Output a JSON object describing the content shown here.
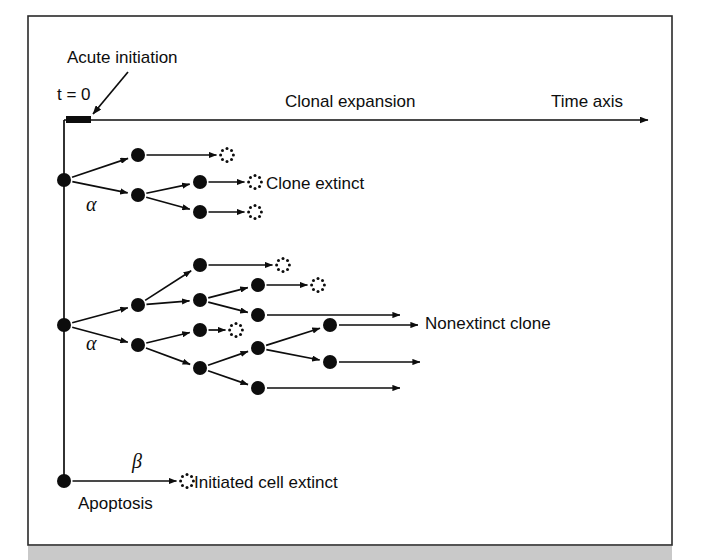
{
  "figure": {
    "kind": "branching-process-diagram",
    "background_color": "#ffffff",
    "ink_color": "#0d0d0d",
    "frame": {
      "x": 28,
      "y": 16,
      "width": 644,
      "height": 529,
      "border_color": "#2a2a2a"
    },
    "scan_bar": {
      "color": "#c9c9c9",
      "x": 28,
      "y": 546,
      "width": 644,
      "height": 14
    }
  },
  "labels": {
    "acute_initiation": "Acute initiation",
    "t_zero": "t = 0",
    "clonal_expansion": "Clonal expansion",
    "time_axis": "Time axis",
    "clone_extinct": "Clone extinct",
    "nonextinct_clone": "Nonextinct clone",
    "initiated_cell_extinct": "Initiated cell extinct",
    "apoptosis": "Apoptosis",
    "alpha_upper": "α",
    "alpha_lower": "α",
    "beta": "β"
  },
  "axes": {
    "vertical": {
      "x": 64,
      "y_top": 120,
      "y_bottom": 481
    },
    "horizontal": {
      "y": 120,
      "x_start": 64,
      "x_end": 648,
      "arrow": "right"
    },
    "origin_tick": {
      "x": 66,
      "y": 116,
      "width": 25,
      "height": 7
    }
  },
  "pointer": {
    "name": "acute-initiation-arrow",
    "x1": 128,
    "y1": 72,
    "x2": 93,
    "y2": 114
  },
  "text_positions": {
    "acute_initiation": {
      "x": 67,
      "y": 63,
      "size": 17
    },
    "t_zero": {
      "x": 57,
      "y": 100,
      "size": 17
    },
    "clonal_expansion": {
      "x": 285,
      "y": 107,
      "size": 17
    },
    "time_axis": {
      "x": 551,
      "y": 107,
      "size": 17
    },
    "clone_extinct": {
      "x": 266,
      "y": 189,
      "size": 17
    },
    "nonextinct_clone": {
      "x": 425,
      "y": 329,
      "size": 17
    },
    "initiated_cell_extinct": {
      "x": 194,
      "y": 488,
      "size": 17
    },
    "apoptosis": {
      "x": 78,
      "y": 509,
      "size": 17
    },
    "alpha_upper": {
      "x": 86,
      "y": 211,
      "size": 20
    },
    "alpha_lower": {
      "x": 86,
      "y": 350,
      "size": 20
    },
    "beta": {
      "x": 132,
      "y": 468,
      "size": 20
    }
  },
  "nodes": [
    {
      "id": "root-upper",
      "type": "cell",
      "x": 64,
      "y": 180,
      "r": 7
    },
    {
      "id": "u-g1-a",
      "type": "cell",
      "x": 138,
      "y": 155,
      "r": 7
    },
    {
      "id": "u-g1-b",
      "type": "cell",
      "x": 138,
      "y": 195,
      "r": 7
    },
    {
      "id": "u-g2-a",
      "type": "cell",
      "x": 200,
      "y": 182,
      "r": 7
    },
    {
      "id": "u-g2-b",
      "type": "cell",
      "x": 200,
      "y": 212,
      "r": 7
    },
    {
      "id": "u-x1",
      "type": "extinct",
      "x": 227,
      "y": 155,
      "r": 7
    },
    {
      "id": "u-x2",
      "type": "extinct",
      "x": 255,
      "y": 182,
      "r": 7
    },
    {
      "id": "u-x3",
      "type": "extinct",
      "x": 255,
      "y": 212,
      "r": 7
    },
    {
      "id": "root-middle",
      "type": "cell",
      "x": 64,
      "y": 325,
      "r": 7
    },
    {
      "id": "m-g1-a",
      "type": "cell",
      "x": 138,
      "y": 305,
      "r": 7
    },
    {
      "id": "m-g1-b",
      "type": "cell",
      "x": 138,
      "y": 345,
      "r": 7
    },
    {
      "id": "m-g2-a",
      "type": "cell",
      "x": 200,
      "y": 265,
      "r": 7
    },
    {
      "id": "m-g2-b",
      "type": "cell",
      "x": 200,
      "y": 300,
      "r": 7
    },
    {
      "id": "m-g2-c",
      "type": "cell",
      "x": 200,
      "y": 330,
      "r": 7
    },
    {
      "id": "m-g2-d",
      "type": "cell",
      "x": 200,
      "y": 368,
      "r": 7
    },
    {
      "id": "m-g3-a",
      "type": "cell",
      "x": 258,
      "y": 285,
      "r": 7
    },
    {
      "id": "m-g3-b",
      "type": "cell",
      "x": 258,
      "y": 315,
      "r": 7
    },
    {
      "id": "m-g3-c",
      "type": "cell",
      "x": 258,
      "y": 348,
      "r": 7
    },
    {
      "id": "m-g3-d",
      "type": "cell",
      "x": 258,
      "y": 388,
      "r": 7
    },
    {
      "id": "m-g4-a",
      "type": "cell",
      "x": 330,
      "y": 325,
      "r": 7
    },
    {
      "id": "m-g4-b",
      "type": "cell",
      "x": 330,
      "y": 362,
      "r": 7
    },
    {
      "id": "m-x1",
      "type": "extinct",
      "x": 283,
      "y": 265,
      "r": 7
    },
    {
      "id": "m-x2",
      "type": "extinct",
      "x": 318,
      "y": 285,
      "r": 7
    },
    {
      "id": "m-x3",
      "type": "extinct",
      "x": 236,
      "y": 330,
      "r": 7
    },
    {
      "id": "root-lower",
      "type": "cell",
      "x": 64,
      "y": 481,
      "r": 7
    },
    {
      "id": "l-x1",
      "type": "extinct",
      "x": 187,
      "y": 481,
      "r": 7
    }
  ],
  "edges": [
    {
      "from": "root-upper",
      "to": "u-g1-a"
    },
    {
      "from": "root-upper",
      "to": "u-g1-b"
    },
    {
      "from": "u-g1-b",
      "to": "u-g2-a"
    },
    {
      "from": "u-g1-b",
      "to": "u-g2-b"
    },
    {
      "from": "u-g1-a",
      "to": "u-x1"
    },
    {
      "from": "u-g2-a",
      "to": "u-x2"
    },
    {
      "from": "u-g2-b",
      "to": "u-x3"
    },
    {
      "from": "root-middle",
      "to": "m-g1-a"
    },
    {
      "from": "root-middle",
      "to": "m-g1-b"
    },
    {
      "from": "m-g1-a",
      "to": "m-g2-a"
    },
    {
      "from": "m-g1-a",
      "to": "m-g2-b"
    },
    {
      "from": "m-g1-b",
      "to": "m-g2-c"
    },
    {
      "from": "m-g1-b",
      "to": "m-g2-d"
    },
    {
      "from": "m-g2-a",
      "to": "m-x1"
    },
    {
      "from": "m-g2-b",
      "to": "m-g3-a"
    },
    {
      "from": "m-g2-b",
      "to": "m-g3-b"
    },
    {
      "from": "m-g2-c",
      "to": "m-x3"
    },
    {
      "from": "m-g2-d",
      "to": "m-g3-c"
    },
    {
      "from": "m-g2-d",
      "to": "m-g3-d"
    },
    {
      "from": "m-g3-a",
      "to": "m-x2"
    },
    {
      "from": "m-g3-c",
      "to": "m-g4-a"
    },
    {
      "from": "m-g3-c",
      "to": "m-g4-b"
    },
    {
      "from": "root-lower",
      "to": "l-x1"
    }
  ],
  "open_edges": [
    {
      "name": "survivor-ray-1",
      "x1": 267,
      "y1": 315,
      "x2": 400,
      "y2": 315
    },
    {
      "name": "survivor-ray-2",
      "x1": 339,
      "y1": 325,
      "x2": 418,
      "y2": 325
    },
    {
      "name": "survivor-ray-3",
      "x1": 339,
      "y1": 362,
      "x2": 420,
      "y2": 362
    },
    {
      "name": "survivor-ray-4",
      "x1": 267,
      "y1": 388,
      "x2": 400,
      "y2": 388
    }
  ]
}
